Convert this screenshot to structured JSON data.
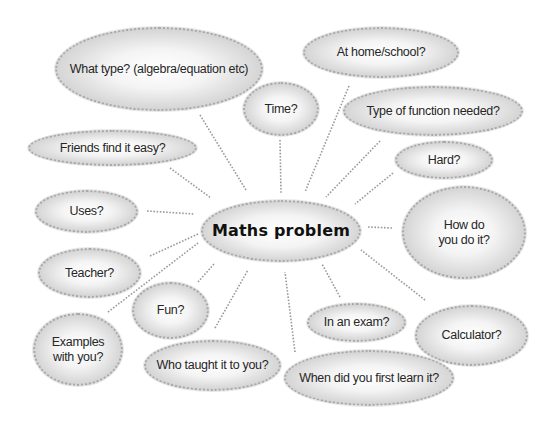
{
  "diagram": {
    "type": "mind-map",
    "colors": {
      "background": "#ffffff",
      "bubble_edge": "#a8a8a8",
      "bubble_center": "#ffffff",
      "text": "#262626",
      "connector": "#9a9a9a"
    },
    "central": {
      "label": "Maths problem",
      "x": 201,
      "y": 200,
      "w": 160,
      "h": 62
    },
    "nodes": [
      {
        "id": "what-type",
        "label": "What type? (algebra/equation etc)",
        "x": 55,
        "y": 27,
        "w": 208,
        "h": 84,
        "link": [
          200,
          115,
          246,
          190
        ]
      },
      {
        "id": "time",
        "label": "Time?",
        "x": 243,
        "y": 82,
        "w": 76,
        "h": 54,
        "link": [
          280,
          140,
          281,
          193
        ]
      },
      {
        "id": "at-home-school",
        "label": "At home/school?",
        "x": 303,
        "y": 27,
        "w": 156,
        "h": 51,
        "link": [
          349,
          86,
          305,
          192
        ]
      },
      {
        "id": "type-of-function",
        "label": "Type of function needed?",
        "x": 343,
        "y": 86,
        "w": 180,
        "h": 50,
        "link": [
          380,
          141,
          326,
          197
        ]
      },
      {
        "id": "hard",
        "label": "Hard?",
        "x": 395,
        "y": 141,
        "w": 98,
        "h": 38,
        "link": [
          393,
          173,
          355,
          204
        ]
      },
      {
        "id": "how-do-you-do-it",
        "label": "How do\nyou do it?",
        "x": 402,
        "y": 186,
        "w": 124,
        "h": 93,
        "link": [
          392,
          228,
          368,
          227
        ]
      },
      {
        "id": "calculator",
        "label": "Calculator?",
        "x": 415,
        "y": 305,
        "w": 113,
        "h": 61,
        "link": [
          425,
          300,
          361,
          250
        ]
      },
      {
        "id": "in-an-exam",
        "label": "In an exam?",
        "x": 307,
        "y": 303,
        "w": 99,
        "h": 39,
        "link": [
          340,
          297,
          322,
          264
        ]
      },
      {
        "id": "when-first-learn",
        "label": "When did you first learn it?",
        "x": 284,
        "y": 350,
        "w": 170,
        "h": 56,
        "link": [
          295,
          352,
          285,
          272
        ]
      },
      {
        "id": "who-taught",
        "label": "Who taught it to you?",
        "x": 144,
        "y": 340,
        "w": 137,
        "h": 51,
        "link": [
          215,
          328,
          248,
          270
        ]
      },
      {
        "id": "fun",
        "label": "Fun?",
        "x": 132,
        "y": 282,
        "w": 77,
        "h": 57,
        "link": [
          198,
          282,
          214,
          264
        ]
      },
      {
        "id": "examples",
        "label": "Examples\nwith you?",
        "x": 33,
        "y": 313,
        "w": 90,
        "h": 73,
        "link": [
          108,
          312,
          198,
          243
        ]
      },
      {
        "id": "teacher",
        "label": "Teacher?",
        "x": 38,
        "y": 248,
        "w": 103,
        "h": 50,
        "link": [
          150,
          256,
          198,
          234
        ]
      },
      {
        "id": "uses",
        "label": "Uses?",
        "x": 35,
        "y": 190,
        "w": 103,
        "h": 43,
        "link": [
          147,
          211,
          194,
          214
        ]
      },
      {
        "id": "friends-easy",
        "label": "Friends find it easy?",
        "x": 28,
        "y": 130,
        "w": 169,
        "h": 36,
        "link": [
          170,
          168,
          211,
          198
        ]
      }
    ]
  }
}
